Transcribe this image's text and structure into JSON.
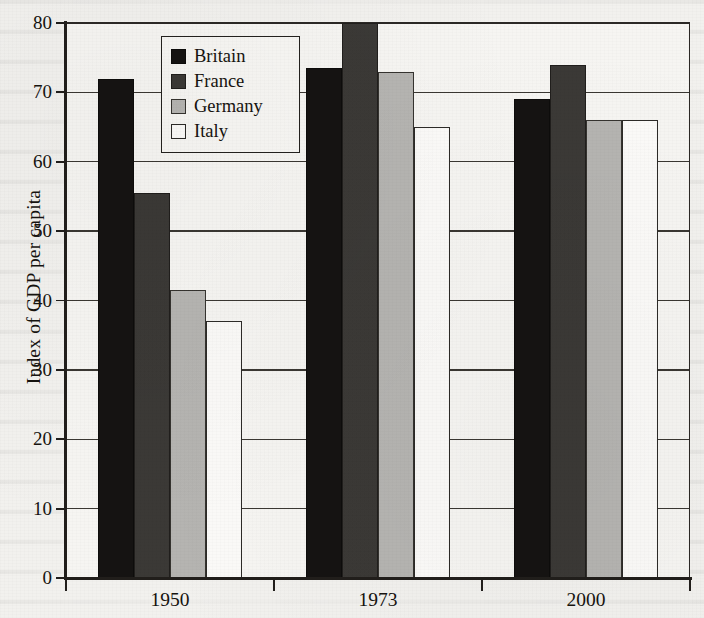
{
  "chart_data": {
    "type": "bar",
    "title": "",
    "xlabel": "",
    "ylabel": "Index of GDP per capita",
    "categories": [
      "1950",
      "1973",
      "2000"
    ],
    "ylim": [
      0,
      80
    ],
    "yticks": [
      0,
      10,
      20,
      30,
      40,
      50,
      60,
      70,
      80
    ],
    "ytick_labels": [
      "0",
      "10",
      "20",
      "30",
      "40",
      "50",
      "60",
      "70",
      "80"
    ],
    "grid": true,
    "legend_position": "top-left-inside",
    "series": [
      {
        "name": "Britain",
        "color": "#151312",
        "values": [
          72,
          73.5,
          69
        ]
      },
      {
        "name": "France",
        "color": "#3b3936",
        "values": [
          55.5,
          80,
          74
        ]
      },
      {
        "name": "Germany",
        "color": "#b5b4b1",
        "values": [
          41.5,
          73,
          66
        ]
      },
      {
        "name": "Italy",
        "color": "#fbfaf8",
        "values": [
          37,
          65,
          66
        ]
      }
    ]
  },
  "axes": {
    "y_label": "Index of GDP per capita",
    "y_ticks": [
      {
        "value": 80,
        "label": "80"
      },
      {
        "value": 70,
        "label": "70"
      },
      {
        "value": 60,
        "label": "60"
      },
      {
        "value": 50,
        "label": "50"
      },
      {
        "value": 40,
        "label": "40"
      },
      {
        "value": 30,
        "label": "30"
      },
      {
        "value": 20,
        "label": "20"
      },
      {
        "value": 10,
        "label": "10"
      },
      {
        "value": 0,
        "label": "0"
      }
    ],
    "x_ticks": [
      {
        "label": "1950"
      },
      {
        "label": "1973"
      },
      {
        "label": "2000"
      }
    ]
  },
  "legend": {
    "entries": [
      {
        "label": "Britain",
        "swatch": "black-filled-square"
      },
      {
        "label": "France",
        "swatch": "dark-gray-filled-square"
      },
      {
        "label": "Germany",
        "swatch": "light-gray-filled-square"
      },
      {
        "label": "Italy",
        "swatch": "white-outlined-square"
      }
    ]
  }
}
